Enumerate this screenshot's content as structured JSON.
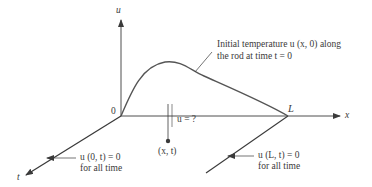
{
  "diagram": {
    "axes": {
      "u_label": "u",
      "x_label": "x",
      "t_label": "t",
      "origin_label": "0",
      "L_label": "L"
    },
    "annotations": {
      "initial_temp_line1": "Initial temperature u (x, 0) along",
      "initial_temp_line2": "the rod at time t = 0",
      "unknown": "u = ?",
      "point": "(x, t)",
      "left_bc_line1": "u (0, t) = 0",
      "left_bc_line2": "for all time",
      "right_bc_line1": "u (L, t) = 0",
      "right_bc_line2": "for all time"
    },
    "colors": {
      "line": "#3a3a3a",
      "curve": "#555555",
      "background": "#ffffff"
    }
  }
}
